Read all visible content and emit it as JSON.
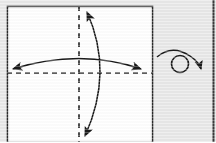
{
  "figure": {
    "canvas": {
      "width": 216,
      "height": 142
    },
    "background_color": "#e9e9e9",
    "ink_color": "#1a1a1a",
    "paper": {
      "label": "square-paper-sheet",
      "fill_color": "#ffffff",
      "border_color": "#2b2b2b",
      "x": 7,
      "y": 6,
      "width": 146,
      "height": 136
    },
    "creases": [
      {
        "name": "vertical-center-crease",
        "type": "valley-fold-dashed",
        "orientation": "vertical",
        "x": 79,
        "y1": 6,
        "y2": 142,
        "dash": "5,4",
        "color": "#2b2b2b"
      },
      {
        "name": "horizontal-center-crease",
        "type": "valley-fold-dashed",
        "orientation": "horizontal",
        "y": 73,
        "x1": 7,
        "x2": 153,
        "dash": "5,4",
        "color": "#2b2b2b"
      }
    ],
    "arrows": [
      {
        "name": "horizontal-fold-arrow",
        "description": "double-headed curved arrow spanning left to right across the horizontal crease",
        "path": "M 13 69 Q 80 48 141 69",
        "heads": [
          "start",
          "end"
        ],
        "color": "#1a1a1a"
      },
      {
        "name": "vertical-fold-arrow",
        "description": "double-headed curved arrow spanning top to bottom across the vertical crease",
        "path": "M 87 12 Q 114 72 85 136",
        "heads": [
          "start",
          "end"
        ],
        "color": "#1a1a1a"
      }
    ],
    "symbols": [
      {
        "name": "turn-over-symbol",
        "glyph": "circle-with-sweeping-arrow",
        "description": "rotate / turn the model over",
        "circle": {
          "cx": 180,
          "cy": 64,
          "r": 8.5
        },
        "arc_path": "M 157 57 Q 172 44 190 56 Q 199 62 201 69",
        "color": "#1a1a1a"
      }
    ],
    "page_edge": {
      "name": "page-gutter-edge",
      "x": 213,
      "color": "#3a3a3a"
    }
  }
}
